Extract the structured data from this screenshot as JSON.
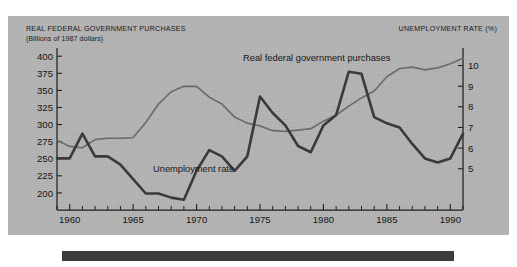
{
  "figure": {
    "background_color": "#b4b4b4",
    "page_color": "#ffffff",
    "bottom_rule_color": "#3b3b3b"
  },
  "header": {
    "left_title": "REAL FEDERAL GOVERNMENT PURCHASES",
    "left_subtitle": "(Billions of 1987 dollars)",
    "right_title": "UNEMPLOYMENT RATE (%)"
  },
  "annotations": {
    "gov_label": "Real federal government purchases",
    "unemp_label": "Unemployment rate"
  },
  "chart_data": {
    "type": "line",
    "title": "",
    "xlabel": "",
    "ylabel": "Billions of 1987 dollars",
    "y2label": "Unemployment rate (%)",
    "grid": false,
    "legend_position": "inline-annotation",
    "xlim": [
      1959,
      1991
    ],
    "ylim": [
      175,
      412
    ],
    "y2lim": [
      3.0,
      10.85
    ],
    "xticks": [
      1960,
      1965,
      1970,
      1975,
      1980,
      1985,
      1990
    ],
    "xticks_minor": [
      1959,
      1961,
      1962,
      1963,
      1964,
      1966,
      1967,
      1968,
      1969,
      1971,
      1972,
      1973,
      1974,
      1976,
      1977,
      1978,
      1979,
      1981,
      1982,
      1983,
      1984,
      1986,
      1987,
      1988,
      1989,
      1991
    ],
    "yticks": [
      200,
      225,
      250,
      275,
      300,
      325,
      350,
      375,
      400
    ],
    "y2ticks": [
      5,
      6,
      7,
      8,
      9,
      10
    ],
    "x": [
      1959,
      1960,
      1961,
      1962,
      1963,
      1964,
      1965,
      1966,
      1967,
      1968,
      1969,
      1970,
      1971,
      1972,
      1973,
      1974,
      1975,
      1976,
      1977,
      1978,
      1979,
      1980,
      1981,
      1982,
      1983,
      1984,
      1985,
      1986,
      1987,
      1988,
      1989,
      1990,
      1991
    ],
    "series": [
      {
        "name": "Real federal government purchases",
        "axis": "left",
        "color": "#6c6c6c",
        "units": "Billions of 1987 dollars",
        "values": [
          277,
          268,
          266,
          278,
          280,
          280,
          281,
          303,
          330,
          348,
          356,
          356,
          340,
          330,
          311,
          302,
          298,
          291,
          290,
          292,
          294,
          305,
          314,
          327,
          339,
          349,
          370,
          382,
          384,
          380,
          383,
          389,
          397
        ]
      },
      {
        "name": "Unemployment rate",
        "axis": "right",
        "color": "#3a3a3a",
        "units": "percent",
        "values": [
          5.5,
          5.5,
          6.7,
          5.6,
          5.6,
          5.2,
          4.5,
          3.8,
          3.8,
          3.6,
          3.5,
          4.9,
          5.9,
          5.6,
          4.9,
          5.6,
          8.5,
          7.7,
          7.1,
          6.1,
          5.8,
          7.1,
          7.6,
          9.7,
          9.6,
          7.5,
          7.2,
          7.0,
          6.2,
          5.5,
          5.3,
          5.5,
          6.7
        ]
      }
    ]
  }
}
